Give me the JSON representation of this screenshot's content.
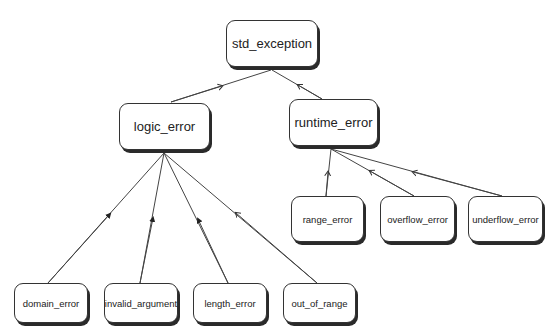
{
  "diagram": {
    "nodes": {
      "std_exception": "std_exception",
      "logic_error": "logic_error",
      "runtime_error": "runtime_error",
      "range_error": "range_error",
      "overflow_error": "overflow_error",
      "underflow_error": "underflow_error",
      "domain_error": "domain_error",
      "invalid_argument": "invalid_argument",
      "length_error": "length_error",
      "out_of_range": "out_of_range"
    },
    "edges": [
      {
        "from": "logic_error",
        "to": "std_exception"
      },
      {
        "from": "runtime_error",
        "to": "std_exception"
      },
      {
        "from": "range_error",
        "to": "runtime_error"
      },
      {
        "from": "overflow_error",
        "to": "runtime_error"
      },
      {
        "from": "underflow_error",
        "to": "runtime_error"
      },
      {
        "from": "domain_error",
        "to": "logic_error"
      },
      {
        "from": "invalid_argument",
        "to": "logic_error"
      },
      {
        "from": "length_error",
        "to": "logic_error"
      },
      {
        "from": "out_of_range",
        "to": "logic_error"
      }
    ],
    "colors": {
      "line": "#333333",
      "box_border": "#333333",
      "shadow": "#2a2a2a",
      "background": "#ffffff"
    }
  }
}
